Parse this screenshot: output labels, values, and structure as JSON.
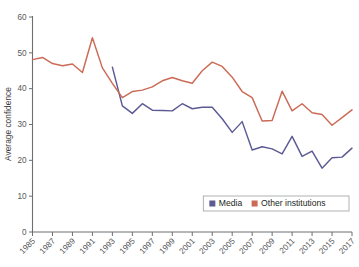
{
  "chart_data": {
    "type": "line",
    "title": "",
    "xlabel": "",
    "ylabel": "Average confidence",
    "xlim": [
      1985,
      2017
    ],
    "ylim": [
      0,
      60
    ],
    "grid": false,
    "legend_position": "bottom-right",
    "x": [
      1985,
      1986,
      1987,
      1988,
      1989,
      1990,
      1991,
      1992,
      1993,
      1994,
      1995,
      1996,
      1997,
      1998,
      1999,
      2000,
      2001,
      2002,
      2003,
      2004,
      2005,
      2006,
      2007,
      2008,
      2009,
      2010,
      2011,
      2012,
      2013,
      2014,
      2015,
      2016,
      2017
    ],
    "xtick_labels": [
      "1985",
      "1987",
      "1989",
      "1991",
      "1993",
      "1995",
      "1997",
      "1999",
      "2001",
      "2003",
      "2005",
      "2007",
      "2009",
      "2011",
      "2013",
      "2015",
      "2017"
    ],
    "ytick_labels": [
      "0",
      "10",
      "20",
      "30",
      "40",
      "50",
      "60"
    ],
    "ytick_values": [
      0,
      10,
      20,
      30,
      40,
      50,
      60
    ],
    "series": [
      {
        "name": "Media",
        "color": "#5b5a93",
        "x": [
          1993,
          1994,
          1995,
          1996,
          1997,
          1998,
          1999,
          2000,
          2001,
          2002,
          2003,
          2004,
          2005,
          2006,
          2007,
          2008,
          2009,
          2010,
          2011,
          2012,
          2013,
          2014,
          2015,
          2016,
          2017
        ],
        "values": [
          46.0,
          35.2,
          33.1,
          35.8,
          34.0,
          33.9,
          33.8,
          35.8,
          34.4,
          34.8,
          34.8,
          31.6,
          27.8,
          30.8,
          22.9,
          23.8,
          23.2,
          21.8,
          26.7,
          21.1,
          22.6,
          17.8,
          20.7,
          20.9,
          23.4
        ]
      },
      {
        "name": "Other institutions",
        "color": "#cb6a55",
        "x": [
          1985,
          1986,
          1987,
          1988,
          1989,
          1990,
          1991,
          1992,
          1993,
          1994,
          1995,
          1996,
          1997,
          1998,
          1999,
          2000,
          2001,
          2002,
          2003,
          2004,
          2005,
          2006,
          2007,
          2008,
          2009,
          2010,
          2011,
          2012,
          2013,
          2014,
          2015,
          2016,
          2017
        ],
        "values": [
          48.1,
          48.7,
          47.0,
          46.4,
          46.9,
          44.5,
          54.2,
          45.8,
          41.5,
          37.5,
          39.2,
          39.6,
          40.5,
          42.2,
          43.1,
          42.2,
          41.5,
          45.0,
          47.4,
          46.2,
          43.2,
          39.2,
          37.5,
          31.0,
          31.1,
          39.3,
          33.8,
          35.8,
          33.3,
          32.8,
          29.8,
          31.9,
          34.1
        ]
      }
    ]
  },
  "legend": {
    "items": [
      {
        "label": "Media",
        "color": "#5b5a93"
      },
      {
        "label": "Other institutions",
        "color": "#cb6a55"
      }
    ]
  },
  "axes": {
    "y_title": "Average confidence"
  }
}
